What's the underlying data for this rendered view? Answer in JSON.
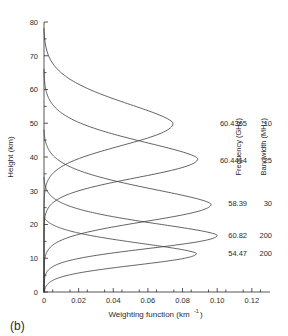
{
  "figure": {
    "panel_label": "(b)"
  },
  "chart_data": {
    "type": "line",
    "title": "",
    "xlabel": "Weighting function (km-1)",
    "xlabel_main": "Weighting function (km",
    "xlabel_exp": "-1",
    "xlabel_close": ")",
    "ylabel": "Height (km)",
    "xlim": [
      0,
      0.1305
    ],
    "ylim": [
      0,
      80
    ],
    "xticks": [
      0,
      0.02,
      0.04,
      0.06,
      0.08,
      0.1,
      0.12
    ],
    "xticklabels": [
      "0",
      "0.02",
      "0.04",
      "0.06",
      "0.08",
      "0.10",
      "0.12"
    ],
    "yticks": [
      0,
      10,
      20,
      30,
      40,
      50,
      60,
      70,
      80
    ],
    "yticklabels": [
      "0",
      "10",
      "20",
      "30",
      "40",
      "50",
      "60",
      "70",
      "80"
    ],
    "xminor_step": 0.01,
    "yminor_step": 5,
    "grid": false,
    "legend_position": "right",
    "legend_headers": [
      "Frequency (GHz)",
      "Bandwidth (MHz)"
    ],
    "series": [
      {
        "name": "60.4365",
        "frequency": "60.4365",
        "bandwidth": "10",
        "peak_height_km": 50.0,
        "peak_value": 0.0745,
        "width_km": 13.5,
        "tail_top_km": 78.0,
        "label_y_km": 50.0
      },
      {
        "name": "60.4414",
        "frequency": "60.4414",
        "bandwidth": "25",
        "peak_height_km": 39.5,
        "peak_value": 0.0888,
        "width_km": 11.5,
        "tail_top_km": 66.0,
        "label_y_km": 39.0
      },
      {
        "name": "58.39",
        "frequency": "58.39",
        "bandwidth": "30",
        "peak_height_km": 26.0,
        "peak_value": 0.0965,
        "width_km": 10.5,
        "tail_top_km": 48.0,
        "label_y_km": 26.5
      },
      {
        "name": "60.82",
        "frequency": "60.82",
        "bandwidth": "200",
        "peak_height_km": 16.8,
        "peak_value": 0.1,
        "width_km": 8.0,
        "tail_top_km": 34.0,
        "label_y_km": 17.0
      },
      {
        "name": "54.47",
        "frequency": "54.47",
        "bandwidth": "200",
        "peak_height_km": 11.4,
        "peak_value": 0.088,
        "width_km": 7.0,
        "tail_top_km": 22.0,
        "label_y_km": 11.5
      }
    ]
  }
}
